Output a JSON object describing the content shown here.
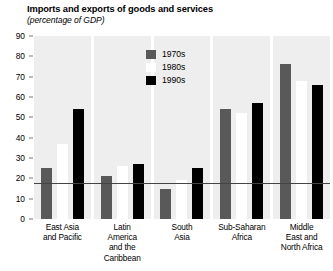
{
  "chart_data": {
    "type": "bar",
    "title": "Imports and exports of goods and services",
    "subtitle": "(percentage of GDP)",
    "xlabel": "",
    "ylabel": "",
    "ylim": [
      0,
      90
    ],
    "yticks": [
      90,
      80,
      70,
      60,
      50,
      40,
      30,
      20,
      10,
      0
    ],
    "grid": false,
    "legend_position": "inside-top-center",
    "categories": [
      "East Asia and Pacific",
      "Latin America and the Caribbean",
      "South Asia",
      "Sub-Saharan Africa",
      "Middle East and North Africa"
    ],
    "category_lines": [
      [
        "East Asia",
        "and Pacific"
      ],
      [
        "Latin",
        "America",
        "and the",
        "Caribbean"
      ],
      [
        "South",
        "Asia"
      ],
      [
        "Sub-Saharan",
        "Africa"
      ],
      [
        "Middle",
        "East and",
        "North Africa"
      ]
    ],
    "series": [
      {
        "name": "1970s",
        "color": "#595959",
        "values": [
          25,
          21,
          15,
          54,
          76
        ]
      },
      {
        "name": "1980s",
        "color": "#ffffff",
        "values": [
          37,
          26,
          19,
          52,
          68
        ]
      },
      {
        "name": "1990s",
        "color": "#000000",
        "values": [
          54,
          27,
          25,
          57,
          66
        ]
      }
    ]
  },
  "colors": {
    "panel_background": "#eeeeee",
    "axis": "#444444",
    "page_background": "#ffffff",
    "text": "#000000"
  }
}
